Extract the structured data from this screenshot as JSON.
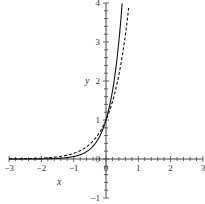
{
  "chart_data": {
    "type": "line",
    "title": "",
    "xlabel": "x",
    "ylabel": "y",
    "xlim": [
      -3,
      3
    ],
    "ylim": [
      -1,
      4
    ],
    "x_ticks": [
      "-3",
      "-2",
      "-1",
      "0",
      "1",
      "2",
      "3"
    ],
    "y_ticks": [
      "-1",
      "0",
      "1",
      "2",
      "3",
      "4"
    ],
    "grid": false,
    "legend": null,
    "series": [
      {
        "name": "solid curve",
        "style": "solid",
        "color": "#000000",
        "x": [
          -3,
          -2,
          -1,
          -0.5,
          0,
          0.25,
          0.5
        ],
        "values": [
          0.0002,
          0.004,
          0.06,
          0.25,
          1.0,
          2.0,
          4.0
        ]
      },
      {
        "name": "dashed curve",
        "style": "dashed",
        "color": "#000000",
        "x": [
          -3,
          -2,
          -1,
          -0.5,
          0,
          0.25,
          0.5,
          0.72
        ],
        "values": [
          0.003,
          0.022,
          0.15,
          0.39,
          1.0,
          1.6,
          2.6,
          4.0
        ]
      }
    ]
  },
  "labels": {
    "x_axis": "x",
    "y_axis": "y",
    "origin_x": "0",
    "origin_y": "0"
  }
}
